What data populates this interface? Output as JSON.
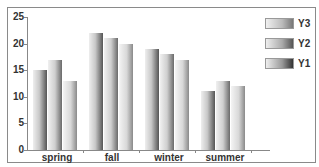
{
  "chart_data": {
    "type": "bar",
    "title": "",
    "xlabel": "",
    "ylabel": "",
    "categories": [
      "spring",
      "fall",
      "winter",
      "summer"
    ],
    "series": [
      {
        "name": "Y1",
        "values": [
          15,
          22,
          19,
          11
        ]
      },
      {
        "name": "Y2",
        "values": [
          17,
          21,
          18,
          13
        ]
      },
      {
        "name": "Y3",
        "values": [
          13,
          20,
          17,
          12
        ]
      }
    ],
    "ylim": [
      0,
      25
    ],
    "yticks": [
      0,
      5,
      10,
      15,
      20,
      25
    ],
    "grid": false,
    "legend": {
      "position": "top-right",
      "entries": [
        "Y3",
        "Y2",
        "Y1"
      ]
    }
  },
  "yticks_labels": [
    "0",
    "5",
    "10",
    "15",
    "20",
    "25"
  ],
  "legend_labels": [
    "Y3",
    "Y2",
    "Y1"
  ]
}
